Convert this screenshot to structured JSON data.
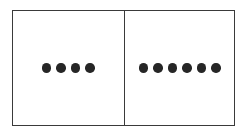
{
  "diagram": {
    "type": "dot-count-panels",
    "panels": [
      {
        "position": "left",
        "dot_count": 4
      },
      {
        "position": "right",
        "dot_count": 6
      }
    ],
    "colors": {
      "stroke": "#3a3a3a",
      "dot": "#262626",
      "background": "#ffffff"
    }
  }
}
